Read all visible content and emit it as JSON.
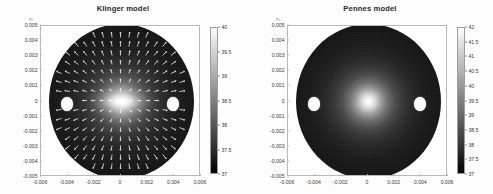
{
  "figure": {
    "background_color": "#fdfdfd",
    "axis_unit_label": "m"
  },
  "panels": [
    {
      "id": "klinger",
      "title": "Klinger model",
      "xlabel": "",
      "ylabel": "",
      "xticks": [
        "-0.006",
        "-0.004",
        "-0.002",
        "0",
        "0.002",
        "0.004",
        "0.006"
      ],
      "xtick_values": [
        -0.006,
        -0.004,
        -0.002,
        0,
        0.002,
        0.004,
        0.006
      ],
      "yticks": [
        "0.005",
        "0.004",
        "0.003",
        "0.002",
        "0.001",
        "0",
        "-0.001",
        "-0.002",
        "-0.003",
        "-0.004",
        "-0.005"
      ],
      "ytick_values": [
        0.005,
        0.004,
        0.003,
        0.002,
        0.001,
        0,
        -0.001,
        -0.002,
        -0.003,
        -0.004,
        -0.005
      ],
      "colorbar_ticks": [
        "40",
        "39.5",
        "39",
        "38.5",
        "38",
        "37.5",
        "37"
      ],
      "colorbar_values": [
        40,
        39.5,
        39,
        38.5,
        38,
        37.5,
        37
      ]
    },
    {
      "id": "pennes",
      "title": "Pennes model",
      "xlabel": "",
      "ylabel": "",
      "xticks": [
        "-0.006",
        "-0.004",
        "-0.002",
        "0",
        "0.002",
        "0.004",
        "0.006"
      ],
      "xtick_values": [
        -0.006,
        -0.004,
        -0.002,
        0,
        0.002,
        0.004,
        0.006
      ],
      "yticks": [
        "0.005",
        "0.004",
        "0.003",
        "0.002",
        "0.001",
        "0",
        "-0.001",
        "-0.002",
        "-0.003",
        "-0.004",
        "-0.005"
      ],
      "ytick_values": [
        0.005,
        0.004,
        0.003,
        0.002,
        0.001,
        0,
        -0.001,
        -0.002,
        -0.003,
        -0.004,
        -0.005
      ],
      "colorbar_ticks": [
        "42",
        "41.5",
        "41",
        "40.5",
        "40",
        "39.5",
        "39",
        "38.5",
        "38",
        "37.5",
        "37"
      ],
      "colorbar_values": [
        42,
        41.5,
        41,
        40.5,
        40,
        39.5,
        39,
        38.5,
        38,
        37.5,
        37
      ]
    }
  ],
  "chart_data": [
    {
      "type": "heatmap",
      "title": "Klinger model",
      "xlabel": "",
      "ylabel": "",
      "colorbar_label": "",
      "xlim": [
        -0.0065,
        0.0065
      ],
      "ylim": [
        -0.0055,
        0.0055
      ],
      "clim": [
        37,
        40.3
      ],
      "colormap": "gray",
      "grid": false,
      "legend": "none",
      "xticks": [
        -0.006,
        -0.004,
        -0.002,
        0,
        0.002,
        0.004,
        0.006
      ],
      "yticks": [
        0.005,
        0.004,
        0.003,
        0.002,
        0.001,
        0,
        -0.001,
        -0.002,
        -0.003,
        -0.004,
        -0.005
      ],
      "colorbar_ticks": [
        40,
        39.5,
        39,
        38.5,
        38,
        37.5,
        37
      ],
      "domain": {
        "shape": "circle",
        "center": [
          0,
          0
        ],
        "radius": 0.005,
        "boundary_temperature": 37
      },
      "hot_spot": {
        "center": [
          0,
          0
        ],
        "peak_temperature": 40.3,
        "shape": "elongated-ellipse",
        "semi_axis_x": 0.0022,
        "semi_axis_y": 0.0008
      },
      "vessels": [
        {
          "center": [
            -0.0035,
            0
          ],
          "radius": 0.00055,
          "fill": "white"
        },
        {
          "center": [
            0.0035,
            0
          ],
          "radius": 0.00055,
          "fill": "white"
        }
      ],
      "overlay": {
        "type": "quiver",
        "description": "white velocity vectors of perfusion flow, directed radially outward from the hot core toward the tissue boundary",
        "color": "#ffffff",
        "grid_nx": 17,
        "grid_ny": 17
      }
    },
    {
      "type": "heatmap",
      "title": "Pennes model",
      "xlabel": "",
      "ylabel": "",
      "colorbar_label": "",
      "xlim": [
        -0.0065,
        0.0065
      ],
      "ylim": [
        -0.0055,
        0.0055
      ],
      "clim": [
        37,
        42.2
      ],
      "colormap": "gray",
      "grid": false,
      "legend": "none",
      "xticks": [
        -0.006,
        -0.004,
        -0.002,
        0,
        0.002,
        0.004,
        0.006
      ],
      "yticks": [
        0.005,
        0.004,
        0.003,
        0.002,
        0.001,
        0,
        -0.001,
        -0.002,
        -0.003,
        -0.004,
        -0.005
      ],
      "colorbar_ticks": [
        42,
        41.5,
        41,
        40.5,
        40,
        39.5,
        39,
        38.5,
        38,
        37.5,
        37
      ],
      "domain": {
        "shape": "circle",
        "center": [
          0,
          0
        ],
        "radius": 0.005,
        "boundary_temperature": 37
      },
      "hot_spot": {
        "center": [
          0,
          0
        ],
        "peak_temperature": 42.2,
        "shape": "radially-symmetric",
        "semi_axis_x": 0.0013,
        "semi_axis_y": 0.0013
      },
      "vessels": [
        {
          "center": [
            -0.0035,
            0
          ],
          "radius": 0.00055,
          "fill": "white"
        },
        {
          "center": [
            0.0035,
            0
          ],
          "radius": 0.00055,
          "fill": "white"
        }
      ],
      "overlay": null
    }
  ]
}
